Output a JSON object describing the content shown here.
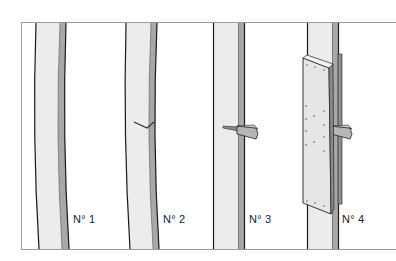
{
  "diagram": {
    "type": "technical illustration",
    "panels": [
      {
        "id": "n1",
        "label": "N° 1",
        "state": "intact curved plank"
      },
      {
        "id": "n2",
        "label": "N° 2",
        "state": "plank with small crack"
      },
      {
        "id": "n3",
        "label": "N° 3",
        "state": "plank with wedge inserted into crack"
      },
      {
        "id": "n4",
        "label": "N° 4",
        "state": "plank reinforced with bolted splint plate and wedge"
      }
    ],
    "colors": {
      "frame": "#9a9a9a",
      "plank_face": "#ececec",
      "plank_edge": "#a8a8a8",
      "outline": "#1a1a1a",
      "plate": "#e6e6e6",
      "bolt": "#9c9c9c",
      "wedge": "#b5b5b5"
    }
  }
}
